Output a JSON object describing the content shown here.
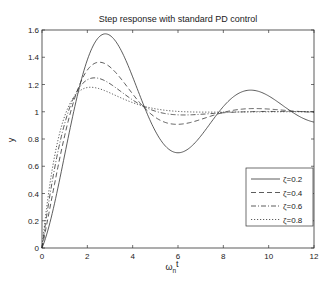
{
  "chart_data": {
    "type": "line",
    "title": "Step response with standard PD control",
    "xlabel": "ω_n t",
    "xlabel_main": "ω",
    "xlabel_sub": "n",
    "xlabel_tail": "t",
    "ylabel": "y",
    "xlim": [
      0,
      12
    ],
    "ylim": [
      0,
      1.6
    ],
    "xticks": [
      0,
      2,
      4,
      6,
      8,
      10,
      12
    ],
    "xtick_labels": [
      "0",
      "2",
      "4",
      "6",
      "8",
      "10",
      "12"
    ],
    "yticks": [
      0,
      0.2,
      0.4,
      0.6,
      0.8,
      1,
      1.2,
      1.4,
      1.6
    ],
    "ytick_labels": [
      "0",
      "0.2",
      "0.4",
      "0.6",
      "0.8",
      "1",
      "1.2",
      "1.4",
      "1.6"
    ],
    "grid": false,
    "legend_position": "lower right",
    "x": [
      0,
      0.5,
      1,
      1.5,
      2,
      2.5,
      3,
      3.5,
      4,
      4.5,
      5,
      5.5,
      6,
      6.5,
      7,
      7.5,
      8,
      8.5,
      9,
      9.5,
      10,
      10.5,
      11,
      11.5,
      12
    ],
    "series": [
      {
        "name": "ζ=0.2",
        "zeta": 0.2,
        "style": "solid",
        "values": [
          0,
          0.3,
          0.73,
          1.15,
          1.45,
          1.58,
          1.55,
          1.38,
          1.15,
          0.93,
          0.77,
          0.7,
          0.71,
          0.79,
          0.9,
          1.01,
          1.1,
          1.15,
          1.16,
          1.13,
          1.08,
          1.02,
          0.97,
          0.94,
          0.93
        ]
      },
      {
        "name": "ζ=0.4",
        "zeta": 0.4,
        "style": "dashed",
        "values": [
          0,
          0.42,
          0.86,
          1.18,
          1.34,
          1.37,
          1.3,
          1.19,
          1.07,
          0.98,
          0.93,
          0.92,
          0.93,
          0.96,
          0.99,
          1.02,
          1.03,
          1.03,
          1.03,
          1.02,
          1.01,
          1.0,
          0.99,
          0.99,
          0.99
        ]
      },
      {
        "name": "ζ=0.6",
        "zeta": 0.6,
        "style": "dashdot",
        "values": [
          0,
          0.52,
          0.95,
          1.18,
          1.25,
          1.23,
          1.17,
          1.1,
          1.04,
          1.0,
          0.98,
          0.97,
          0.98,
          0.99,
          1.0,
          1.0,
          1.01,
          1.01,
          1.0,
          1.0,
          1.0,
          1.0,
          1.0,
          1.0,
          1.0
        ]
      },
      {
        "name": "ζ=0.8",
        "zeta": 0.8,
        "style": "dotted",
        "values": [
          0,
          0.61,
          1.02,
          1.17,
          1.18,
          1.14,
          1.09,
          1.05,
          1.02,
          1.0,
          0.99,
          0.99,
          0.99,
          1.0,
          1.0,
          1.0,
          1.0,
          1.0,
          1.0,
          1.0,
          1.0,
          1.0,
          1.0,
          1.0,
          1.0
        ]
      }
    ]
  }
}
